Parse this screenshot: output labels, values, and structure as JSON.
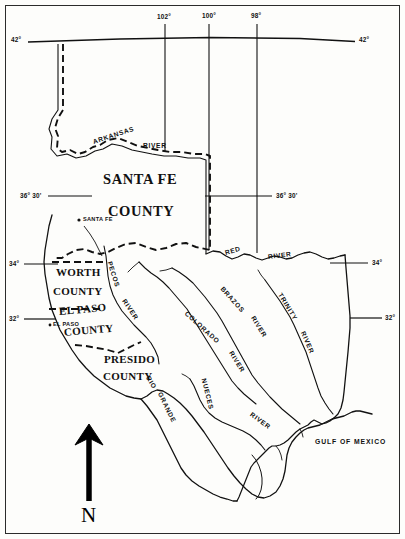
{
  "map": {
    "title": "Santa Fe County map of Texas",
    "counties": [
      {
        "id": "santa-fe",
        "line1": "SANTA FE",
        "line2": "COUNTY"
      },
      {
        "id": "worth",
        "line1": "WORTH",
        "line2": "COUNTY"
      },
      {
        "id": "el-paso",
        "line1": "EL PASO",
        "line2": "COUNTY"
      },
      {
        "id": "presido",
        "line1": "PRESIDO",
        "line2": "COUNTY"
      }
    ],
    "cities": [
      {
        "id": "santa-fe-city",
        "label": "SANTA FE",
        "marker": "bullet-marker"
      },
      {
        "id": "el-paso-city",
        "label": "EL PASO",
        "marker": "bullet-marker"
      }
    ],
    "rivers": [
      {
        "id": "arkansas",
        "name": "ARKANSAS",
        "suffix": "RIVER"
      },
      {
        "id": "red",
        "name": "RED",
        "suffix": "RIVER"
      },
      {
        "id": "colorado",
        "name": "COLORADO",
        "suffix": "RIVER"
      },
      {
        "id": "brazos",
        "name": "BRAZOS",
        "suffix": "RIVER"
      },
      {
        "id": "trinity",
        "name": "TRINITY",
        "suffix": "RIVER"
      },
      {
        "id": "pecos",
        "name": "PECOS",
        "suffix": "RIVER"
      },
      {
        "id": "rio-grande",
        "name": "RIO",
        "suffix": "GRANDE"
      },
      {
        "id": "nueces",
        "name": "NUECES",
        "suffix": "RIVER"
      }
    ],
    "water_bodies": [
      {
        "id": "gulf",
        "label": "GULF OF MEXICO"
      }
    ],
    "latitudes": [
      {
        "id": "lat-42-left",
        "label": "42°"
      },
      {
        "id": "lat-42-right",
        "label": "42°"
      },
      {
        "id": "lat-3630-left",
        "label": "36° 30'"
      },
      {
        "id": "lat-3630-right",
        "label": "36° 30'"
      },
      {
        "id": "lat-34-left",
        "label": "34°"
      },
      {
        "id": "lat-34-right",
        "label": "34°"
      },
      {
        "id": "lat-32-left",
        "label": "32°"
      },
      {
        "id": "lat-32-right",
        "label": "32°"
      }
    ],
    "longitudes": [
      {
        "id": "lon-102",
        "label": "102°"
      },
      {
        "id": "lon-100",
        "label": "100°"
      },
      {
        "id": "lon-98",
        "label": "98°"
      }
    ],
    "compass": {
      "label": "N",
      "icon": "north-arrow-icon"
    },
    "colors": {
      "ink": "#111111",
      "paper": "#fdfdfb",
      "frame": "#2b2b2b"
    }
  }
}
